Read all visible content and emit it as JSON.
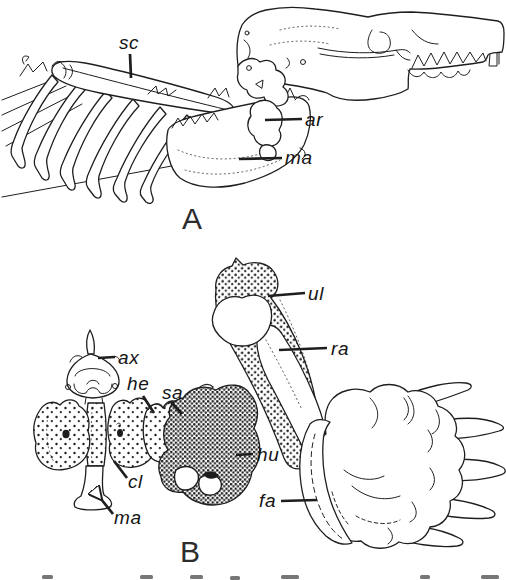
{
  "figure": {
    "colors": {
      "ink": "#1e1e1e",
      "paper": "#ffffff"
    },
    "panel_a": {
      "letter": "A",
      "labels": {
        "sc": "sc",
        "ar": "ar",
        "ma": "ma"
      }
    },
    "panel_b": {
      "letter": "B",
      "labels": {
        "ul": "ul",
        "ra": "ra",
        "ax": "ax",
        "he": "he",
        "sa": "sa",
        "cl": "cl",
        "ma": "ma",
        "hu": "hu",
        "fa": "fa"
      }
    }
  }
}
